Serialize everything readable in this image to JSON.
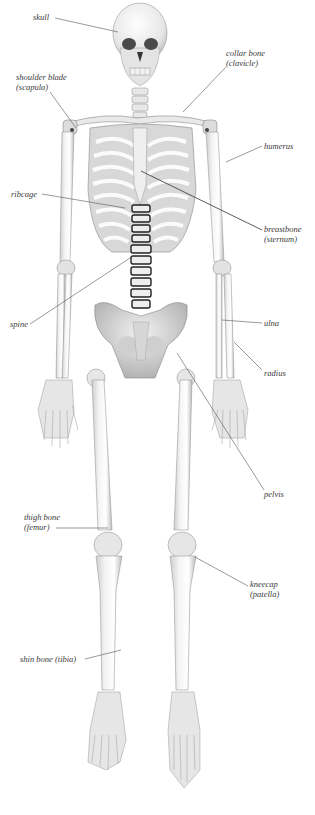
{
  "diagram": {
    "type": "anatomical-labeled-illustration",
    "label_color": "#3a3a3a",
    "leader_line_color": "#555555",
    "labels": [
      {
        "id": "skull",
        "line1": "skull",
        "line2": ""
      },
      {
        "id": "shoulder-blade",
        "line1": "shoulder blade",
        "line2": "(scapula)"
      },
      {
        "id": "collar-bone",
        "line1": "collar bone",
        "line2": "(clavicle)"
      },
      {
        "id": "humerus",
        "line1": "humerus",
        "line2": ""
      },
      {
        "id": "ribcage",
        "line1": "ribcage",
        "line2": ""
      },
      {
        "id": "breastbone",
        "line1": "breastbone",
        "line2": "(sternum)"
      },
      {
        "id": "spine",
        "line1": "spine",
        "line2": ""
      },
      {
        "id": "ulna",
        "line1": "ulna",
        "line2": ""
      },
      {
        "id": "radius",
        "line1": "radius",
        "line2": ""
      },
      {
        "id": "pelvis",
        "line1": "pelvis",
        "line2": ""
      },
      {
        "id": "thigh-bone",
        "line1": "thigh bone",
        "line2": "(femur)"
      },
      {
        "id": "kneecap",
        "line1": "kneecap",
        "line2": "(patella)"
      },
      {
        "id": "shin-bone",
        "line1": "shin bone (tibia)",
        "line2": ""
      }
    ]
  }
}
